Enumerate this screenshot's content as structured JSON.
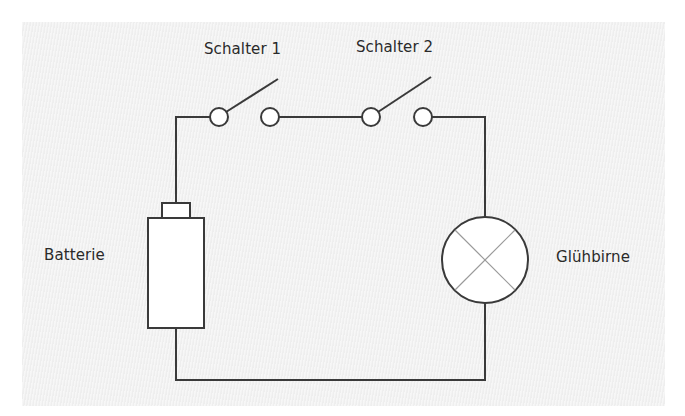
{
  "labels": {
    "switch1": "Schalter 1",
    "switch2": "Schalter 2",
    "battery": "Batterie",
    "bulb": "Glühbirne"
  },
  "colors": {
    "background": "#f2f2f2",
    "wire": "#3a3a3a",
    "component_fill": "#ffffff",
    "bulb_cross": "#9a9a9a",
    "text": "#2a2a2a"
  },
  "components": [
    {
      "type": "battery",
      "label": "Batterie"
    },
    {
      "type": "switch",
      "label": "Schalter 1",
      "state": "open"
    },
    {
      "type": "switch",
      "label": "Schalter 2",
      "state": "open"
    },
    {
      "type": "lamp",
      "label": "Glühbirne"
    }
  ]
}
